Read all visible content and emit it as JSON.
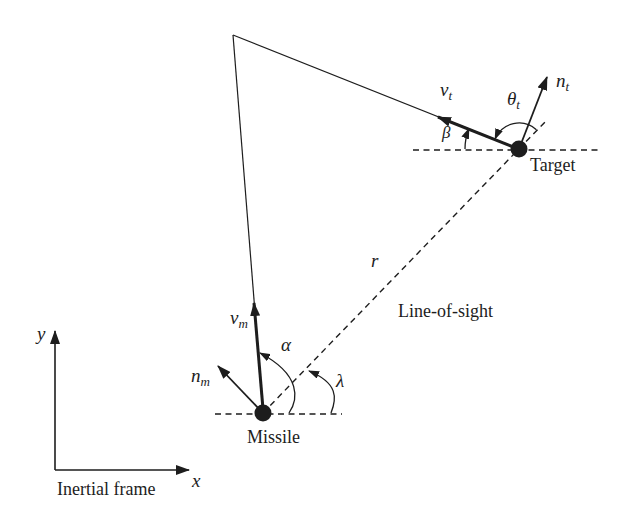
{
  "figure": {
    "type": "missile-target-engagement-geometry-diagram",
    "colors": {
      "ink": "#1d1d1d",
      "background": "#ffffff"
    },
    "vectors": {
      "vt": {
        "main": "v",
        "sub": "t"
      },
      "nt": {
        "main": "n",
        "sub": "t"
      },
      "vm": {
        "main": "v",
        "sub": "m"
      },
      "nm": {
        "main": "n",
        "sub": "m"
      }
    },
    "angles": {
      "theta_t": {
        "main": "θ",
        "sub": "t"
      },
      "beta": "β",
      "alpha": "α",
      "lambda": "λ"
    },
    "labels": {
      "range": "r",
      "line_of_sight": "Line-of-sight",
      "missile": "Missile",
      "target": "Target",
      "inertial_frame": "Inertial frame",
      "x_axis": "x",
      "y_axis": "y"
    }
  }
}
